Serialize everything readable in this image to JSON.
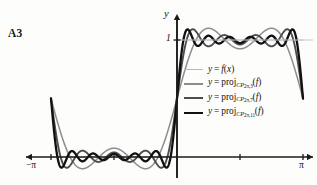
{
  "panel": {
    "label": "A3"
  },
  "axes": {
    "y_axis_name": "y",
    "x_axis_name": "",
    "y_tick_label": "1",
    "x_tick_left_label": "−π",
    "x_tick_right_label": "π",
    "axis_color": "#1b1b1b"
  },
  "legend": {
    "entries": [
      {
        "lhs": "y",
        "eq": "=",
        "fn": "f",
        "arg": "x",
        "kind": "function",
        "label": "y = f(x)",
        "color": "#b9b9b9",
        "width": 1.2
      },
      {
        "lhs": "y",
        "eq": "=",
        "op": "proj",
        "space": "CP",
        "sub_period": "2π",
        "sub_degree": "3",
        "arg": "f",
        "kind": "projection",
        "label": "y = proj_CP(2π,3)(f)",
        "color": "#8d8d8d",
        "width": 1.5
      },
      {
        "lhs": "y",
        "eq": "=",
        "op": "proj",
        "space": "CP",
        "sub_period": "2π",
        "sub_degree": "7",
        "arg": "f",
        "kind": "projection",
        "label": "y = proj_CP(2π,7)(f)",
        "color": "#4d4d4d",
        "width": 1.9
      },
      {
        "lhs": "y",
        "eq": "=",
        "op": "proj",
        "space": "CP",
        "sub_period": "2π",
        "sub_degree": "11",
        "arg": "f",
        "kind": "projection",
        "label": "y = proj_CP(2π,11)(f)",
        "color": "#111111",
        "width": 2.3
      }
    ]
  },
  "chart_data": {
    "type": "line",
    "title": "",
    "subtitle": "",
    "xlabel": "",
    "ylabel": "y",
    "xlim": [
      -3.14159265,
      3.14159265
    ],
    "xtick_values": [
      -3.14159265,
      -1.57079633,
      0,
      1.57079633,
      3.14159265
    ],
    "xtick_labels": [
      "−π",
      "",
      "",
      "",
      "π"
    ],
    "ylim": [
      -0.35,
      1.45
    ],
    "ytick_values": [
      1
    ],
    "ytick_labels": [
      "1"
    ],
    "grid": false,
    "legend_position": "inside-right",
    "target_function": {
      "name": "f(x)",
      "description": "square wave: 0 on (-π,0), 1 on (0,π)",
      "values_at_samples": [
        {
          "x": -3.14159265,
          "y": 0
        },
        {
          "x": -1.57079633,
          "y": 0
        },
        {
          "x": -0.0001,
          "y": 0
        },
        {
          "x": 0.0001,
          "y": 1
        },
        {
          "x": 1.57079633,
          "y": 1
        },
        {
          "x": 3.14159265,
          "y": 1
        }
      ]
    },
    "series": [
      {
        "name": "y = f(x)",
        "kind": "target",
        "harmonics": 0,
        "color": "#b9b9b9",
        "width": 1.2
      },
      {
        "name": "y = proj_{CP_{2π,3}}(f)",
        "kind": "fourier-partial-sum",
        "harmonics": 3,
        "color": "#8d8d8d",
        "width": 1.5
      },
      {
        "name": "y = proj_{CP_{2π,7}}(f)",
        "kind": "fourier-partial-sum",
        "harmonics": 7,
        "color": "#4d4d4d",
        "width": 1.9
      },
      {
        "name": "y = proj_{CP_{2π,11}}(f)",
        "kind": "fourier-partial-sum",
        "harmonics": 11,
        "color": "#111111",
        "width": 2.3
      }
    ]
  },
  "geometry": {
    "x_axis_y_px": 157,
    "y_axis_x_px": 177,
    "x_left_px": 22,
    "x_right_px": 313,
    "y_one_px": 40,
    "y_top_px": 14
  }
}
